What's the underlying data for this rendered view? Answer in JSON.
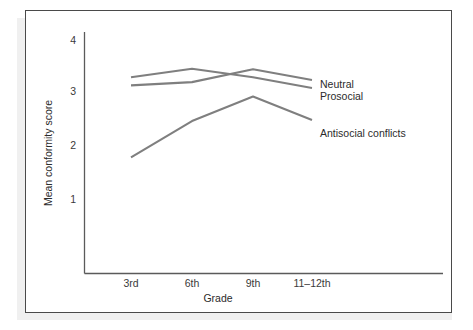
{
  "figure": {
    "background_color": "#ffffff",
    "frame_color": "#4a4a4a",
    "axis_color": "#5a5a5a"
  },
  "chart_data": {
    "type": "line",
    "title": "",
    "xlabel": "Grade",
    "ylabel": "Mean conformity score",
    "categories": [
      "3rd",
      "6th",
      "9th",
      "11–12th"
    ],
    "xtick_labels": [
      "3rd",
      "6th",
      "9th",
      "11–12th"
    ],
    "ytick_labels": [
      "1",
      "2",
      "3",
      "4"
    ],
    "ytick_values": [
      1,
      2,
      3,
      4
    ],
    "ylim": [
      0.55,
      4.35
    ],
    "grid": false,
    "legend_position": "right-inline-labels",
    "series": [
      {
        "name": "Neutral",
        "color": "#7f7f7f",
        "values": [
          3.3,
          3.46,
          3.3,
          3.1
        ]
      },
      {
        "name": "Prosocial",
        "color": "#7f7f7f",
        "values": [
          3.15,
          3.21,
          3.45,
          3.25
        ]
      },
      {
        "name": "Antisocial conflicts",
        "color": "#7f7f7f",
        "values": [
          1.8,
          2.48,
          2.94,
          2.5
        ]
      }
    ],
    "annotations": [
      {
        "text": "Neutral",
        "series": "Neutral"
      },
      {
        "text": "Prosocial",
        "series": "Prosocial"
      },
      {
        "text": "Antisocial conflicts",
        "series": "Antisocial conflicts"
      }
    ]
  }
}
